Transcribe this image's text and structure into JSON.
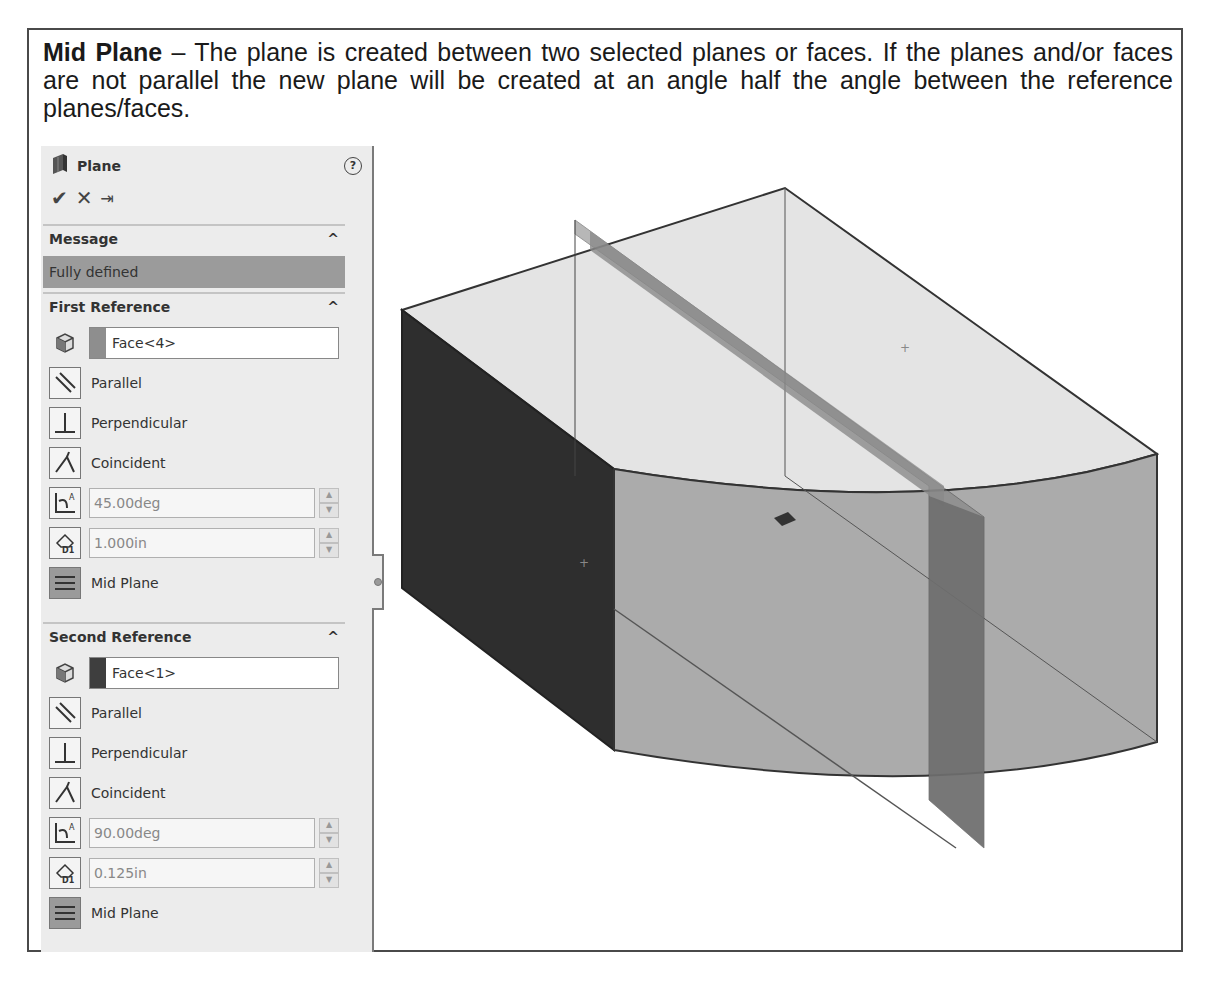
{
  "caption": {
    "term": "Mid Plane",
    "text": " – The plane is created between two selected planes or faces. If the planes and/or faces are not parallel the new plane will be created at an angle half the angle between the reference planes/faces."
  },
  "panel": {
    "title": "Plane",
    "icons": {
      "feature": "plane-icon",
      "help": "help-icon"
    },
    "help_glyph": "?",
    "actions": {
      "ok": "✔",
      "cancel": "✕",
      "pin": "⇥"
    },
    "message": {
      "header": "Message",
      "status": "Fully defined"
    },
    "first_reference": {
      "header": "First Reference",
      "selection": "Face<4>",
      "swatch_color": "#8e8e8e",
      "options": [
        "Parallel",
        "Perpendicular",
        "Coincident"
      ],
      "angle": "45.00deg",
      "distance": "1.000in",
      "mid_plane_label": "Mid Plane"
    },
    "second_reference": {
      "header": "Second Reference",
      "selection": "Face<1>",
      "swatch_color": "#3e3e3e",
      "options": [
        "Parallel",
        "Perpendicular",
        "Coincident"
      ],
      "angle": "90.00deg",
      "distance": "0.125in",
      "mid_plane_label": "Mid Plane"
    },
    "collapse_glyph": "^"
  },
  "viewport": {
    "colors": {
      "dark_face": "#2d2d2d",
      "front_face": "#a9a9a9",
      "top_face": "#e3e3e3",
      "mid_plane": "#7d7d7d"
    }
  }
}
